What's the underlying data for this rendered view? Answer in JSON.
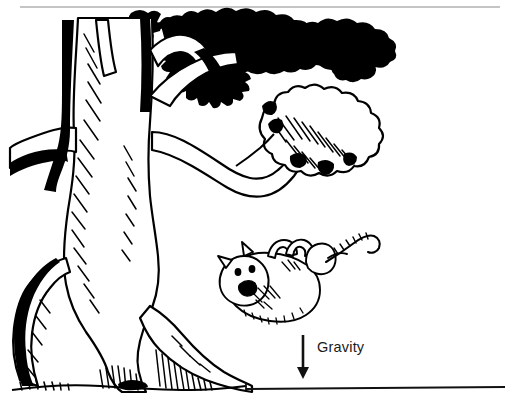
{
  "figure": {
    "kind": "line-drawing-illustration",
    "style": "black-and-white pen-and-ink hatched illustration",
    "width": 510,
    "height": 414,
    "background_color": "#ffffff",
    "ink_color": "#000000"
  },
  "annotations": {
    "gravity_label": "Gravity",
    "gravity_label_color": "#1a1a1a",
    "arrow": {
      "name": "gravity-arrow",
      "direction": "down",
      "x": 303,
      "top_y": 335,
      "bottom_y": 377,
      "color": "#111111"
    }
  },
  "rules": {
    "top_rule": {
      "x1": 20,
      "x2": 500,
      "y": 7,
      "color": "#8a8a8a",
      "thickness": 1.2
    },
    "ground_line": {
      "x1": 246,
      "x2": 505,
      "y": 389,
      "color": "#111111",
      "thickness": 1.6
    }
  },
  "scene_objects": [
    {
      "name": "tree-trunk",
      "description": "large gnarled trunk with hatched shading on the left"
    },
    {
      "name": "tree-roots",
      "description": "spreading roots at the base of the trunk"
    },
    {
      "name": "upper-branch",
      "description": "branch reaching up-right into the dark canopy"
    },
    {
      "name": "lower-branch",
      "description": "long branch reaching right toward a foliage cluster"
    },
    {
      "name": "top-canopy-foliage",
      "description": "dense dark leaf mass across the top"
    },
    {
      "name": "right-foliage-cluster",
      "description": "cloud-shaped hatched leaf cluster mid-right"
    },
    {
      "name": "falling-cat",
      "description": "cat drawn upside down in mid-air with splayed paws and curled tail"
    },
    {
      "name": "cat-head",
      "description": "round head with two pointed ears, round eyes and open mouth"
    },
    {
      "name": "cat-tail",
      "description": "curled striped tail at upper right of the cat"
    },
    {
      "name": "ground",
      "description": "flat ground line at lower right"
    }
  ]
}
